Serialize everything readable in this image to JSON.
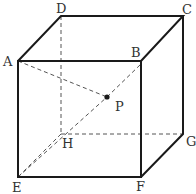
{
  "figure": {
    "type": "cube",
    "vertices": {
      "A": {
        "label": "A",
        "x": 18,
        "y": 61
      },
      "B": {
        "label": "B",
        "x": 141,
        "y": 61
      },
      "C": {
        "label": "C",
        "x": 183,
        "y": 16
      },
      "D": {
        "label": "D",
        "x": 61,
        "y": 16
      },
      "E": {
        "label": "E",
        "x": 18,
        "y": 177
      },
      "F": {
        "label": "F",
        "x": 141,
        "y": 177
      },
      "G": {
        "label": "G",
        "x": 183,
        "y": 134
      },
      "H": {
        "label": "H",
        "x": 61,
        "y": 134
      }
    },
    "point": {
      "label": "P",
      "x": 107,
      "y": 97
    },
    "solid_edges": [
      [
        "A",
        "B"
      ],
      [
        "B",
        "F"
      ],
      [
        "F",
        "E"
      ],
      [
        "E",
        "A"
      ],
      [
        "A",
        "D"
      ],
      [
        "D",
        "C"
      ],
      [
        "C",
        "B"
      ],
      [
        "C",
        "G"
      ],
      [
        "G",
        "F"
      ]
    ],
    "dashed_edges": [
      [
        "D",
        "H"
      ],
      [
        "H",
        "E"
      ],
      [
        "H",
        "G"
      ]
    ],
    "dashed_diagonals": [
      [
        "A",
        "P"
      ],
      [
        "E",
        "P"
      ]
    ],
    "colors": {
      "stroke": "#1a1a1a",
      "dashed": "#555555",
      "label": "#333333"
    }
  }
}
